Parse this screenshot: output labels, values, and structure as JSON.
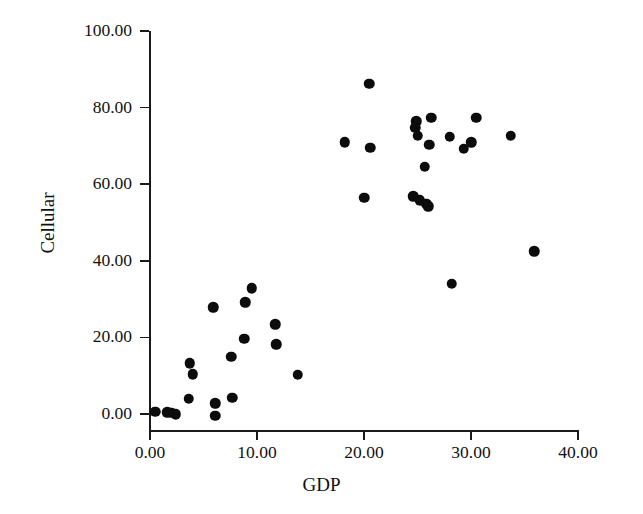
{
  "chart_data": {
    "type": "scatter",
    "title": "",
    "xlabel": "GDP",
    "ylabel": "Cellular",
    "xlim": [
      0,
      40
    ],
    "ylim": [
      0,
      100
    ],
    "xticks": [
      "0.00",
      "10.00",
      "20.00",
      "30.00",
      "40.00"
    ],
    "xtick_values": [
      0,
      10,
      20,
      30,
      40
    ],
    "yticks": [
      "0.00",
      "20.00",
      "40.00",
      "60.00",
      "80.00",
      "100.00"
    ],
    "ytick_values": [
      0,
      20,
      40,
      60,
      80,
      100
    ],
    "grid": false,
    "legend": null,
    "marker": "filled-circle",
    "marker_color": "#0c0c0c",
    "points": [
      {
        "x": 0.5,
        "y": 0.6
      },
      {
        "x": 1.6,
        "y": 0.4
      },
      {
        "x": 2.0,
        "y": 0.3
      },
      {
        "x": 2.4,
        "y": 0.0
      },
      {
        "x": 3.6,
        "y": 4.0
      },
      {
        "x": 3.7,
        "y": 13.2
      },
      {
        "x": 4.0,
        "y": 10.4
      },
      {
        "x": 5.9,
        "y": 27.9
      },
      {
        "x": 6.1,
        "y": 2.8
      },
      {
        "x": 6.1,
        "y": -0.5
      },
      {
        "x": 7.6,
        "y": 15.0
      },
      {
        "x": 7.7,
        "y": 4.2
      },
      {
        "x": 8.8,
        "y": 19.6
      },
      {
        "x": 8.9,
        "y": 29.2
      },
      {
        "x": 9.5,
        "y": 32.8
      },
      {
        "x": 11.7,
        "y": 23.4
      },
      {
        "x": 11.8,
        "y": 18.2
      },
      {
        "x": 13.8,
        "y": 10.2
      },
      {
        "x": 18.2,
        "y": 70.9
      },
      {
        "x": 20.0,
        "y": 56.5
      },
      {
        "x": 20.5,
        "y": 86.2
      },
      {
        "x": 20.6,
        "y": 69.5
      },
      {
        "x": 24.6,
        "y": 56.9
      },
      {
        "x": 24.8,
        "y": 74.8
      },
      {
        "x": 24.9,
        "y": 76.5
      },
      {
        "x": 25.0,
        "y": 72.7
      },
      {
        "x": 25.2,
        "y": 55.8
      },
      {
        "x": 25.7,
        "y": 64.6
      },
      {
        "x": 25.8,
        "y": 54.9
      },
      {
        "x": 26.0,
        "y": 54.2
      },
      {
        "x": 26.1,
        "y": 70.3
      },
      {
        "x": 26.3,
        "y": 77.3
      },
      {
        "x": 28.0,
        "y": 72.4
      },
      {
        "x": 28.2,
        "y": 34.0
      },
      {
        "x": 29.3,
        "y": 69.2
      },
      {
        "x": 30.0,
        "y": 70.9
      },
      {
        "x": 30.5,
        "y": 77.4
      },
      {
        "x": 33.7,
        "y": 72.6
      },
      {
        "x": 35.9,
        "y": 42.5
      }
    ]
  },
  "axis_titles": {
    "x": "GDP",
    "y": "Cellular"
  }
}
